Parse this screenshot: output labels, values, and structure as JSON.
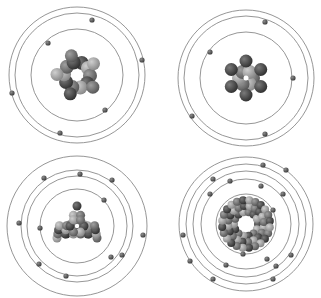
{
  "figure": {
    "colors": {
      "background": "#ffffff",
      "orbit": "#8a8a8a",
      "electron": "#5a5a5a",
      "nucleus_dark": "#3c3c3c",
      "nucleus_mid": "#6e6e6e",
      "nucleus_light": "#a6a6a6"
    }
  },
  "atoms": [
    {
      "id": "top-left",
      "center": [
        77,
        75
      ],
      "orbits": [
        46,
        62,
        68
      ],
      "nucleus": {
        "shape": "ring",
        "ring_radius": 13,
        "balls": 10,
        "ball_r": 7
      },
      "electrons": [
        [
          48,
          43
        ],
        [
          92,
          20
        ],
        [
          142,
          60
        ],
        [
          12,
          93
        ],
        [
          105,
          110
        ],
        [
          60,
          133
        ]
      ]
    },
    {
      "id": "top-right",
      "center": [
        246,
        78
      ],
      "orbits": [
        46,
        62,
        68
      ],
      "nucleus": {
        "shape": "star",
        "ring_radius": 7,
        "balls": 6,
        "ball_r": 7,
        "outer_radius": 17,
        "outer_balls": 6
      },
      "electrons": [
        [
          210,
          52
        ],
        [
          265,
          22
        ],
        [
          293,
          78
        ],
        [
          192,
          116
        ],
        [
          265,
          134
        ]
      ]
    },
    {
      "id": "bottom-left",
      "center": [
        77,
        226
      ],
      "orbits": [
        37,
        50,
        56,
        70
      ],
      "nucleus": {
        "shape": "triangle",
        "ball_r": 4.5
      },
      "electrons": [
        [
          104,
          200
        ],
        [
          40,
          228
        ],
        [
          19,
          223
        ],
        [
          44,
          178
        ],
        [
          80,
          174
        ],
        [
          112,
          180
        ],
        [
          111,
          257
        ],
        [
          122,
          255
        ],
        [
          143,
          235
        ],
        [
          39,
          264
        ],
        [
          66,
          276
        ]
      ]
    },
    {
      "id": "bottom-right",
      "center": [
        246,
        224
      ],
      "orbits": [
        30,
        45,
        53,
        60,
        67
      ],
      "nucleus": {
        "shape": "thick-ring",
        "ball_r": 4
      },
      "electrons": [
        [
          273,
          210
        ],
        [
          243,
          254
        ],
        [
          210,
          194
        ],
        [
          183,
          235
        ],
        [
          230,
          181
        ],
        [
          261,
          186
        ],
        [
          283,
          194
        ],
        [
          267,
          259
        ],
        [
          276,
          266
        ],
        [
          226,
          265
        ],
        [
          291,
          255
        ],
        [
          213,
          179
        ],
        [
          213,
          279
        ],
        [
          273,
          279
        ],
        [
          190,
          261
        ],
        [
          263,
          165
        ],
        [
          286,
          170
        ]
      ]
    }
  ]
}
